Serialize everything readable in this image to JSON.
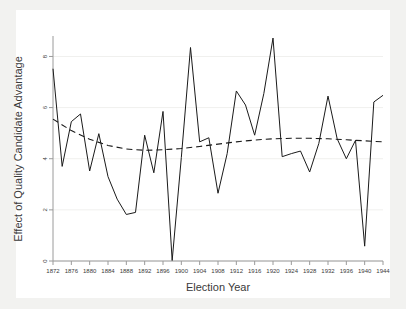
{
  "figure": {
    "background": "#f2f2f0",
    "plot_background": "#ffffff",
    "line_color": "#1a1a1a",
    "axis_color": "#9a9a9a"
  },
  "chart_data": {
    "type": "line",
    "title": "",
    "xlabel": "Election Year",
    "ylabel": "Effect of Quality Candidate Advantage",
    "xlim": [
      1872,
      1944
    ],
    "ylim": [
      0,
      8.8
    ],
    "xticks": [
      1872,
      1876,
      1880,
      1884,
      1888,
      1892,
      1896,
      1900,
      1904,
      1908,
      1912,
      1916,
      1920,
      1924,
      1928,
      1932,
      1936,
      1940,
      1944
    ],
    "xtick_labels": [
      "1872",
      "1876",
      "1880",
      "1884",
      "1888",
      "1892",
      "1896",
      "1900",
      "1904",
      "1908",
      "1912",
      "1916",
      "1920",
      "1924",
      "1928",
      "1932",
      "1936",
      "1940",
      "1944"
    ],
    "yticks": [
      0,
      2,
      4,
      6,
      8
    ],
    "ytick_labels": [
      "0",
      "2",
      "4",
      "6",
      "8"
    ],
    "grid": "horizontal-faint",
    "legend": "none",
    "series": [
      {
        "name": "Effect of Quality Candidate Advantage",
        "style": "solid",
        "x": [
          1872,
          1874,
          1876,
          1878,
          1880,
          1882,
          1884,
          1886,
          1888,
          1890,
          1892,
          1894,
          1896,
          1898,
          1900,
          1902,
          1904,
          1906,
          1908,
          1910,
          1912,
          1914,
          1916,
          1918,
          1920,
          1922,
          1924,
          1926,
          1928,
          1930,
          1932,
          1934,
          1936,
          1938,
          1940,
          1942,
          1944
        ],
        "values": [
          7.52,
          3.7,
          5.45,
          5.75,
          3.52,
          4.98,
          3.3,
          2.42,
          1.82,
          1.9,
          4.92,
          3.45,
          5.85,
          0.02,
          4.05,
          8.35,
          4.66,
          4.82,
          2.65,
          4.2,
          6.65,
          6.1,
          4.92,
          6.55,
          8.72,
          4.08,
          4.2,
          4.3,
          3.48,
          4.6,
          6.45,
          4.78,
          4.0,
          4.72,
          0.58,
          6.22,
          6.48
        ]
      },
      {
        "name": "Quadratic trend",
        "style": "dashed",
        "x": [
          1872,
          1876,
          1880,
          1884,
          1888,
          1892,
          1896,
          1900,
          1904,
          1908,
          1912,
          1916,
          1920,
          1924,
          1928,
          1932,
          1936,
          1940,
          1944
        ],
        "values": [
          5.55,
          5.1,
          4.76,
          4.52,
          4.38,
          4.33,
          4.35,
          4.4,
          4.48,
          4.57,
          4.66,
          4.73,
          4.78,
          4.8,
          4.8,
          4.78,
          4.74,
          4.7,
          4.66
        ]
      }
    ]
  }
}
